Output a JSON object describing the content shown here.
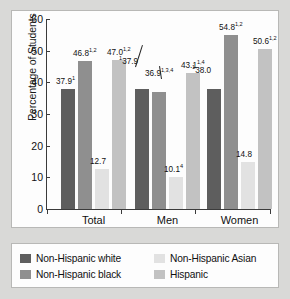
{
  "chart_data": {
    "type": "bar",
    "title": "",
    "xlabel": "",
    "ylabel": "Percentage of Students",
    "ylim": [
      0,
      60
    ],
    "yticks": [
      0,
      10,
      20,
      30,
      40,
      50,
      60
    ],
    "grid": false,
    "legend_position": "bottom",
    "categories": [
      "Total",
      "Men",
      "Women"
    ],
    "series": [
      {
        "name": "Non-Hispanic white",
        "color": "#5e5e5e",
        "values": [
          37.9,
          37.9,
          38.0
        ],
        "labels": [
          "37.9",
          "37.9",
          "38.0"
        ],
        "sup_pre": [
          "",
          "1",
          "1"
        ],
        "sup_post": [
          "1",
          "",
          ""
        ]
      },
      {
        "name": "Non-Hispanic black",
        "color": "#8f8f8f",
        "values": [
          46.8,
          36.9,
          54.8
        ],
        "labels": [
          "46.8",
          "36.9",
          "54.8"
        ],
        "sup_pre": [
          "",
          "",
          ""
        ],
        "sup_post": [
          "1,2",
          "1,3,4",
          "1,2"
        ]
      },
      {
        "name": "Non-Hispanic Asian",
        "color": "#e2e2e2",
        "values": [
          12.7,
          10.1,
          14.8
        ],
        "labels": [
          "12.7",
          "10.1",
          "14.8"
        ],
        "sup_pre": [
          "",
          "",
          ""
        ],
        "sup_post": [
          "",
          "4",
          ""
        ]
      },
      {
        "name": "Hispanic",
        "color": "#c2c2c2",
        "values": [
          47.0,
          43.1,
          50.6
        ],
        "labels": [
          "47.0",
          "43.1",
          "50.6"
        ],
        "sup_pre": [
          "",
          "",
          ""
        ],
        "sup_post": [
          "1,2",
          "1,4",
          "1,2"
        ]
      }
    ]
  },
  "legend": {
    "items": [
      {
        "label": "Non-Hispanic white",
        "color": "#5e5e5e"
      },
      {
        "label": "Non-Hispanic Asian",
        "color": "#e2e2e2"
      },
      {
        "label": "Non-Hispanic black",
        "color": "#8f8f8f"
      },
      {
        "label": "Hispanic",
        "color": "#c2c2c2"
      }
    ]
  }
}
